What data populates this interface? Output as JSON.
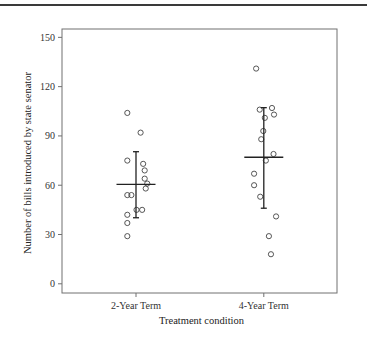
{
  "chart_data": {
    "type": "scatter",
    "subtype": "strip-plot-with-mean-and-error-bars",
    "title": "",
    "xlabel": "Treatment condition",
    "ylabel": "Number of bills introduced by state senator",
    "categories": [
      "2-Year Term",
      "4-Year Term"
    ],
    "ylim": [
      0,
      150
    ],
    "yticks": [
      0,
      30,
      60,
      90,
      120,
      150
    ],
    "grid": false,
    "legend": "none",
    "series": [
      {
        "name": "2-Year Term",
        "points": [
          104,
          92,
          75,
          73,
          69,
          64,
          61,
          58,
          54,
          54,
          45,
          45,
          42,
          37,
          29
        ],
        "jitter": [
          -0.17,
          0.09,
          -0.17,
          0.14,
          0.17,
          0.17,
          0.22,
          0.19,
          -0.17,
          -0.09,
          0.01,
          0.12,
          -0.17,
          -0.17,
          -0.17
        ],
        "mean": 60.5,
        "error_low": 40.2,
        "error_high": 80.4
      },
      {
        "name": "4-Year Term",
        "points": [
          131,
          107,
          106,
          103,
          101,
          93,
          88,
          79,
          75,
          67,
          60,
          53,
          41,
          29,
          18
        ],
        "jitter": [
          -0.15,
          0.16,
          -0.08,
          0.2,
          0.02,
          -0.01,
          -0.05,
          0.19,
          0.04,
          -0.19,
          -0.19,
          -0.07,
          0.24,
          0.1,
          0.14
        ],
        "mean": 77,
        "error_low": 46,
        "error_high": 107.2
      }
    ]
  },
  "colors": {
    "frame": "#707070",
    "marker_stroke": "#444444",
    "summary_line": "#222222",
    "top_rule": "#3a3a3a"
  }
}
